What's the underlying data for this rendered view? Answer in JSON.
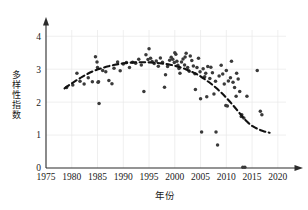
{
  "chart_data": {
    "type": "scatter",
    "title": "",
    "xlabel": "年份",
    "ylabel": "多样性指数",
    "xlim": [
      1975,
      2021
    ],
    "ylim": [
      0,
      4.25
    ],
    "xticks": [
      1975,
      1980,
      1985,
      1990,
      1995,
      2000,
      2005,
      2010,
      2015,
      2020
    ],
    "xtick_labels": [
      "1975",
      "1980",
      "1985",
      "1990",
      "1995",
      "2000",
      "2005",
      "2010",
      "2015",
      "2020"
    ],
    "yticks": [
      0,
      1,
      2,
      3,
      4
    ],
    "ytick_labels": [
      "0",
      "1",
      "2",
      "3",
      "4"
    ],
    "grid": "both-faint",
    "legend": "none",
    "point_color": "#3a3a3a",
    "trend_color": "#111111",
    "axis_color": "#2b2b2b",
    "axis_style": "arrow-ended-left-and-bottom",
    "series": [
      {
        "name": "多样性指数观测值",
        "marker": "circle",
        "points": [
          [
            1979.0,
            2.44
          ],
          [
            1980.2,
            2.52
          ],
          [
            1981.0,
            2.88
          ],
          [
            1981.6,
            2.63
          ],
          [
            1982.4,
            2.55
          ],
          [
            1983.2,
            2.74
          ],
          [
            1984.0,
            2.62
          ],
          [
            1984.6,
            3.38
          ],
          [
            1984.9,
            3.22
          ],
          [
            1985.0,
            3.05
          ],
          [
            1985.1,
            2.6
          ],
          [
            1985.2,
            2.62
          ],
          [
            1985.3,
            1.96
          ],
          [
            1986.0,
            2.96
          ],
          [
            1986.6,
            2.92
          ],
          [
            1987.2,
            2.66
          ],
          [
            1987.8,
            2.56
          ],
          [
            1988.2,
            3.03
          ],
          [
            1988.9,
            3.22
          ],
          [
            1989.4,
            2.95
          ],
          [
            1990.0,
            3.16
          ],
          [
            1990.6,
            3.2
          ],
          [
            1991.2,
            3.05
          ],
          [
            1991.8,
            3.21
          ],
          [
            1992.4,
            3.18
          ],
          [
            1993.0,
            3.3
          ],
          [
            1993.5,
            3.13
          ],
          [
            1994.0,
            2.32
          ],
          [
            1994.4,
            3.44
          ],
          [
            1994.8,
            3.29
          ],
          [
            1995.0,
            3.62
          ],
          [
            1995.3,
            3.33
          ],
          [
            1995.6,
            3.23
          ],
          [
            1996.0,
            3.17
          ],
          [
            1996.4,
            3.25
          ],
          [
            1996.8,
            3.09
          ],
          [
            1997.2,
            3.34
          ],
          [
            1997.6,
            3.21
          ],
          [
            1998.0,
            2.45
          ],
          [
            1998.2,
            2.83
          ],
          [
            1998.6,
            3.08
          ],
          [
            1999.0,
            3.27
          ],
          [
            1999.3,
            3.36
          ],
          [
            1999.6,
            3.3
          ],
          [
            1999.9,
            3.2
          ],
          [
            2000.0,
            3.5
          ],
          [
            2000.2,
            3.45
          ],
          [
            2000.4,
            3.24
          ],
          [
            2000.6,
            3.12
          ],
          [
            2000.8,
            3.02
          ],
          [
            2001.0,
            2.88
          ],
          [
            2001.3,
            3.22
          ],
          [
            2001.6,
            3.31
          ],
          [
            2001.9,
            3.13
          ],
          [
            2002.2,
            3.48
          ],
          [
            2002.5,
            3.05
          ],
          [
            2002.8,
            2.94
          ],
          [
            2003.0,
            3.4
          ],
          [
            2003.3,
            3.26
          ],
          [
            2003.6,
            3.1
          ],
          [
            2003.9,
            2.86
          ],
          [
            2004.0,
            2.38
          ],
          [
            2004.3,
            3.05
          ],
          [
            2004.6,
            3.33
          ],
          [
            2004.9,
            2.92
          ],
          [
            2005.0,
            2.1
          ],
          [
            2005.2,
            1.09
          ],
          [
            2005.5,
            3.01
          ],
          [
            2005.8,
            2.77
          ],
          [
            2006.0,
            2.88
          ],
          [
            2006.4,
            3.08
          ],
          [
            2006.8,
            2.72
          ],
          [
            2007.0,
            3.06
          ],
          [
            2007.3,
            2.89
          ],
          [
            2007.6,
            2.25
          ],
          [
            2007.9,
            2.63
          ],
          [
            2008.0,
            1.09
          ],
          [
            2008.3,
            0.7
          ],
          [
            2008.6,
            2.79
          ],
          [
            2009.0,
            3.12
          ],
          [
            2009.3,
            2.85
          ],
          [
            2009.6,
            2.55
          ],
          [
            2009.9,
            1.9
          ],
          [
            2010.0,
            2.96
          ],
          [
            2010.4,
            2.64
          ],
          [
            2010.8,
            2.74
          ],
          [
            2011.0,
            3.24
          ],
          [
            2011.3,
            2.6
          ],
          [
            2011.6,
            2.44
          ],
          [
            2011.9,
            2.18
          ],
          [
            2012.0,
            2.88
          ],
          [
            2012.3,
            2.7
          ],
          [
            2012.6,
            2.32
          ],
          [
            2012.9,
            1.56
          ],
          [
            2013.0,
            1.62
          ],
          [
            2013.4,
            1.52
          ],
          [
            2014.0,
            2.18
          ],
          [
            2016.0,
            2.96
          ],
          [
            2016.6,
            1.72
          ],
          [
            2016.9,
            1.62
          ],
          [
            2013.2,
            0.02
          ],
          [
            2013.6,
            0.02
          ],
          [
            2006.2,
            2.16
          ],
          [
            2002.0,
            3.37
          ],
          [
            2010.2,
            1.88
          ]
        ]
      }
    ],
    "trend": {
      "name": "拟合趋势线(虚线)",
      "style": "dashed",
      "points": [
        [
          1978.6,
          2.42
        ],
        [
          1979.6,
          2.53
        ],
        [
          1980.6,
          2.63
        ],
        [
          1981.6,
          2.73
        ],
        [
          1982.6,
          2.82
        ],
        [
          1983.6,
          2.9
        ],
        [
          1984.6,
          2.97
        ],
        [
          1985.6,
          3.02
        ],
        [
          1986.6,
          3.07
        ],
        [
          1987.6,
          3.11
        ],
        [
          1988.6,
          3.14
        ],
        [
          1989.6,
          3.17
        ],
        [
          1990.6,
          3.19
        ],
        [
          1991.6,
          3.2
        ],
        [
          1992.6,
          3.21
        ],
        [
          1993.6,
          3.21
        ],
        [
          1994.6,
          3.21
        ],
        [
          1995.6,
          3.2
        ],
        [
          1996.6,
          3.19
        ],
        [
          1997.6,
          3.17
        ],
        [
          1998.6,
          3.15
        ],
        [
          1999.6,
          3.12
        ],
        [
          2000.6,
          3.08
        ],
        [
          2001.6,
          3.03
        ],
        [
          2002.6,
          2.97
        ],
        [
          2003.6,
          2.9
        ],
        [
          2004.6,
          2.82
        ],
        [
          2005.6,
          2.72
        ],
        [
          2006.6,
          2.61
        ],
        [
          2007.6,
          2.49
        ],
        [
          2008.6,
          2.35
        ],
        [
          2009.6,
          2.2
        ],
        [
          2010.6,
          2.03
        ],
        [
          2011.6,
          1.85
        ],
        [
          2012.6,
          1.66
        ],
        [
          2013.6,
          1.47
        ],
        [
          2014.6,
          1.32
        ],
        [
          2015.6,
          1.22
        ],
        [
          2016.6,
          1.15
        ],
        [
          2017.6,
          1.1
        ],
        [
          2018.4,
          1.07
        ]
      ]
    }
  }
}
